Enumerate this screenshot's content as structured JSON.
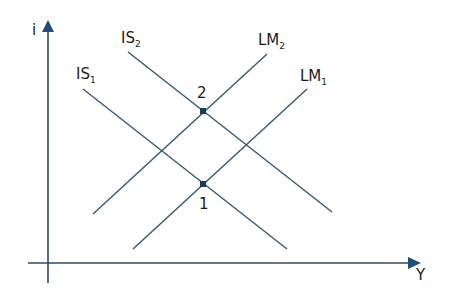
{
  "diagram": {
    "type": "IS-LM model",
    "colors": {
      "line": "#3d5a73",
      "axis": "#2e4a66",
      "arrowhead": "#1f4f78",
      "point": "#163d5e",
      "text": "#1a1a1a"
    },
    "axes": {
      "y_label": "i",
      "x_label": "Y"
    },
    "curves": [
      {
        "id": "IS2",
        "base": "IS",
        "sub": "2"
      },
      {
        "id": "IS1",
        "base": "IS",
        "sub": "1"
      },
      {
        "id": "LM2",
        "base": "LM",
        "sub": "2"
      },
      {
        "id": "LM1",
        "base": "LM",
        "sub": "1"
      }
    ],
    "points": [
      {
        "label": "2",
        "description": "intersection of IS2 and LM2"
      },
      {
        "label": "1",
        "description": "intersection of IS1 and LM1"
      }
    ]
  }
}
